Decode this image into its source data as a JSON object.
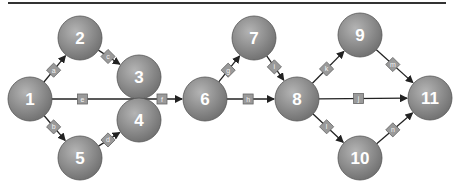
{
  "diagram": {
    "type": "network-graph",
    "header_rule": {
      "x1": 8,
      "x2": 446,
      "y": 3,
      "color": "#333333"
    },
    "colors": {
      "node_fill_light": "#b4b4b4",
      "node_fill_dark": "#6e6e6e",
      "node_stroke": "#555555",
      "node_text": "#ffffff",
      "edge": "#222222",
      "edge_label_fill": "#9a9a9a",
      "edge_label_stroke": "#666666"
    },
    "node_radius": 22,
    "nodes": [
      {
        "id": "1",
        "label": "1",
        "x": 30,
        "y": 99
      },
      {
        "id": "2",
        "label": "2",
        "x": 80,
        "y": 38
      },
      {
        "id": "3",
        "label": "3",
        "x": 139,
        "y": 77
      },
      {
        "id": "4",
        "label": "4",
        "x": 139,
        "y": 120
      },
      {
        "id": "5",
        "label": "5",
        "x": 80,
        "y": 158
      },
      {
        "id": "6",
        "label": "6",
        "x": 205,
        "y": 99
      },
      {
        "id": "7",
        "label": "7",
        "x": 254,
        "y": 38
      },
      {
        "id": "8",
        "label": "8",
        "x": 297,
        "y": 99
      },
      {
        "id": "9",
        "label": "9",
        "x": 360,
        "y": 35
      },
      {
        "id": "10",
        "label": "10",
        "x": 360,
        "y": 158
      },
      {
        "id": "11",
        "label": "11",
        "x": 430,
        "y": 98
      }
    ],
    "edges": [
      {
        "from": "1",
        "to": "2",
        "label": "a",
        "box": "diamond"
      },
      {
        "from": "1",
        "to": "5",
        "label": "b",
        "box": "diamond"
      },
      {
        "from": "2",
        "to": "3",
        "label": "c",
        "box": "diamond"
      },
      {
        "from": "5",
        "to": "4",
        "label": "d",
        "box": "diamond"
      },
      {
        "from": "1",
        "to": "6",
        "label": "e",
        "box": "square",
        "label_at": 0.35,
        "arrow": false
      },
      {
        "from": "3",
        "to": "6",
        "label": "f",
        "box": "square",
        "straight_from": [
          140,
          99
        ],
        "label_pos": [
          162,
          99
        ]
      },
      {
        "from": "6",
        "to": "7",
        "label": "g",
        "box": "diamond"
      },
      {
        "from": "6",
        "to": "8",
        "label": "h",
        "box": "square"
      },
      {
        "from": "7",
        "to": "8",
        "label": "i",
        "box": "diamond"
      },
      {
        "from": "8",
        "to": "9",
        "label": "k",
        "box": "diamond"
      },
      {
        "from": "8",
        "to": "11",
        "label": "j",
        "box": "square"
      },
      {
        "from": "8",
        "to": "10",
        "label": "l",
        "box": "diamond"
      },
      {
        "from": "9",
        "to": "11",
        "label": "m",
        "box": "diamond"
      },
      {
        "from": "10",
        "to": "11",
        "label": "n",
        "box": "diamond"
      }
    ]
  }
}
